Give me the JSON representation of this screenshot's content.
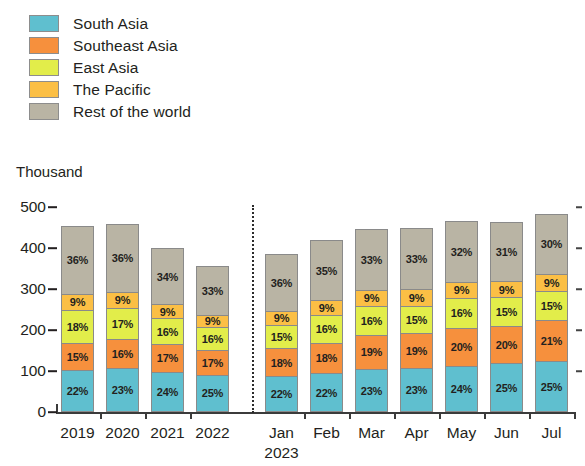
{
  "legend": {
    "items": [
      {
        "label": "South Asia",
        "color": "#5fbfcf"
      },
      {
        "label": "Southeast Asia",
        "color": "#f6903d"
      },
      {
        "label": "East Asia",
        "color": "#e2ed4a"
      },
      {
        "label": "The Pacific",
        "color": "#fbbf45"
      },
      {
        "label": "Rest of the world",
        "color": "#b9b4a4"
      }
    ]
  },
  "axis": {
    "unit": "Thousand",
    "y_ticks": [
      "500",
      "400",
      "300",
      "200",
      "100",
      "0"
    ]
  },
  "chart_data": {
    "type": "bar",
    "title": "",
    "subtitle": "",
    "xlabel": "",
    "ylabel": "Thousand",
    "ylim": [
      0,
      500
    ],
    "ytick_values": [
      0,
      100,
      200,
      300,
      400,
      500
    ],
    "grid": false,
    "stacked": true,
    "stack_mode": "absolute totals with percent-share labels",
    "legend_position": "top-left",
    "annotations": [
      "dashed vertical divider between annual bars and 2023 monthly bars"
    ],
    "categories": [
      "2019",
      "2020",
      "2021",
      "2022",
      "Jan 2023",
      "Feb",
      "Mar",
      "Apr",
      "May",
      "Jun",
      "Jul"
    ],
    "category_lines": [
      {
        "l1": "2019",
        "l2": ""
      },
      {
        "l1": "2020",
        "l2": ""
      },
      {
        "l1": "2021",
        "l2": ""
      },
      {
        "l1": "2022",
        "l2": ""
      },
      {
        "l1": "Jan",
        "l2": "2023"
      },
      {
        "l1": "Feb",
        "l2": ""
      },
      {
        "l1": "Mar",
        "l2": ""
      },
      {
        "l1": "Apr",
        "l2": ""
      },
      {
        "l1": "May",
        "l2": ""
      },
      {
        "l1": "Jun",
        "l2": ""
      },
      {
        "l1": "Jul",
        "l2": ""
      }
    ],
    "totals": [
      463,
      463,
      410,
      366,
      396,
      430,
      455,
      464,
      472,
      474,
      493
    ],
    "series": [
      {
        "name": "South Asia",
        "color": "#5fbfcf",
        "values": [
          22,
          23,
          24,
          25,
          22,
          22,
          23,
          23,
          24,
          25,
          25
        ],
        "labels": [
          "22%",
          "23%",
          "24%",
          "25%",
          "22%",
          "22%",
          "23%",
          "23%",
          "24%",
          "25%",
          "25%"
        ]
      },
      {
        "name": "Southeast Asia",
        "color": "#f6903d",
        "values": [
          15,
          16,
          17,
          17,
          18,
          18,
          19,
          19,
          20,
          20,
          21
        ],
        "labels": [
          "15%",
          "16%",
          "17%",
          "17%",
          "18%",
          "18%",
          "19%",
          "19%",
          "20%",
          "20%",
          "21%"
        ]
      },
      {
        "name": "East Asia",
        "color": "#e2ed4a",
        "values": [
          18,
          17,
          16,
          16,
          15,
          16,
          16,
          15,
          16,
          15,
          15
        ],
        "labels": [
          "18%",
          "17%",
          "16%",
          "16%",
          "15%",
          "16%",
          "16%",
          "15%",
          "16%",
          "15%",
          "15%"
        ]
      },
      {
        "name": "The Pacific",
        "color": "#fbbf45",
        "values": [
          9,
          9,
          9,
          9,
          9,
          9,
          9,
          9,
          9,
          9,
          9
        ],
        "labels": [
          "9%",
          "9%",
          "9%",
          "9%",
          "9%",
          "9%",
          "9%",
          "9%",
          "9%",
          "9%",
          "9%"
        ]
      },
      {
        "name": "Rest of the world",
        "color": "#b9b4a4",
        "values": [
          36,
          36,
          34,
          33,
          36,
          35,
          33,
          33,
          32,
          31,
          30
        ],
        "labels": [
          "36%",
          "36%",
          "34%",
          "33%",
          "36%",
          "35%",
          "33%",
          "33%",
          "32%",
          "31%",
          "30%"
        ]
      }
    ]
  }
}
